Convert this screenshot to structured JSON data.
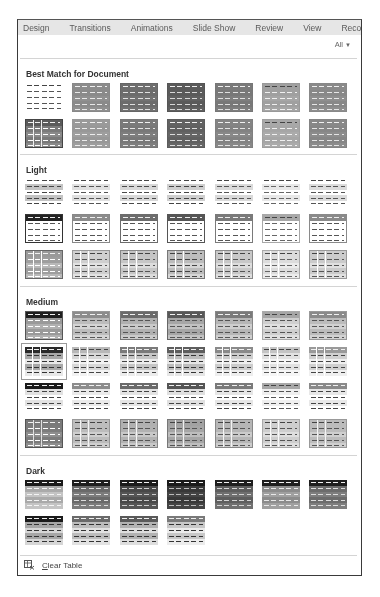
{
  "tabs": [
    "Design",
    "Transitions",
    "Animations",
    "Slide Show",
    "Review",
    "View",
    "Record"
  ],
  "filter": {
    "label": "All",
    "icon": "chevron-down-icon"
  },
  "sections": [
    {
      "title": "Best Match for Document",
      "top": 49,
      "grid_top": 63,
      "rows": [
        [
          {
            "hdr": "#ffffff",
            "body": "#ffffff",
            "band": "#ffffff",
            "dash": "#555",
            "border": "none",
            "vl": "transparent"
          },
          {
            "hdr": "#8c8c8c",
            "body": "#909090",
            "band": "#8a8a8a",
            "dash": "#e8e8e8",
            "border": "#888",
            "vl": "transparent"
          },
          {
            "hdr": "#6e6e6e",
            "body": "#727272",
            "band": "#6c6c6c",
            "dash": "#e0e0e0",
            "border": "#666",
            "vl": "transparent"
          },
          {
            "hdr": "#5a5a5a",
            "body": "#606060",
            "band": "#5a5a5a",
            "dash": "#d8d8d8",
            "border": "#555",
            "vl": "transparent"
          },
          {
            "hdr": "#7a7a7a",
            "body": "#7e7e7e",
            "band": "#787878",
            "dash": "#e0e0e0",
            "border": "#777",
            "vl": "transparent"
          },
          {
            "hdr": "#a0a0a0",
            "body": "#a6a6a6",
            "band": "#a0a0a0",
            "dash": "#f0f0f0",
            "border": "#999",
            "vl": "transparent"
          },
          {
            "hdr": "#8a8a8a",
            "body": "#8e8e8e",
            "band": "#888888",
            "dash": "#e6e6e6",
            "border": "#888",
            "vl": "transparent"
          }
        ],
        [
          {
            "hdr": "#5a5a5a",
            "body": "#8a8a8a",
            "band": "#7a7a7a",
            "dash": "#ffffff",
            "border": "#444",
            "vl": "#f0f0f0"
          },
          {
            "hdr": "#9a9a9a",
            "body": "#9e9e9e",
            "band": "#989898",
            "dash": "#ececec",
            "border": "#999",
            "vl": "transparent"
          },
          {
            "hdr": "#7a7a7a",
            "body": "#7e7e7e",
            "band": "#787878",
            "dash": "#e4e4e4",
            "border": "#777",
            "vl": "transparent"
          },
          {
            "hdr": "#626262",
            "body": "#666666",
            "band": "#606060",
            "dash": "#dcdcdc",
            "border": "#5c5c5c",
            "vl": "transparent"
          },
          {
            "hdr": "#848484",
            "body": "#888888",
            "band": "#828282",
            "dash": "#e4e4e4",
            "border": "#808080",
            "vl": "transparent"
          },
          {
            "hdr": "#a8a8a8",
            "body": "#ababab",
            "band": "#a6a6a6",
            "dash": "#f0f0f0",
            "border": "#a0a0a0",
            "vl": "transparent"
          },
          {
            "hdr": "#888888",
            "body": "#8c8c8c",
            "band": "#868686",
            "dash": "#e4e4e4",
            "border": "#848484",
            "vl": "transparent"
          }
        ]
      ]
    },
    {
      "title": "Light",
      "top": 145,
      "grid_top": 158,
      "rows": [
        [
          {
            "hdr": "#ffffff",
            "body": "#ffffff",
            "band": "#c4c4c4",
            "dash": "#444",
            "border": "none",
            "vl": "transparent"
          },
          {
            "hdr": "#ffffff",
            "body": "#ffffff",
            "band": "#e0e0e0",
            "dash": "#555",
            "border": "none",
            "vl": "transparent"
          },
          {
            "hdr": "#ffffff",
            "body": "#ffffff",
            "band": "#d8d8d8",
            "dash": "#4a4a4a",
            "border": "none",
            "vl": "transparent"
          },
          {
            "hdr": "#ffffff",
            "body": "#ffffff",
            "band": "#cfcfcf",
            "dash": "#444",
            "border": "none",
            "vl": "transparent"
          },
          {
            "hdr": "#ffffff",
            "body": "#ffffff",
            "band": "#dadada",
            "dash": "#555",
            "border": "none",
            "vl": "transparent"
          },
          {
            "hdr": "#ffffff",
            "body": "#ffffff",
            "band": "#e8e8e8",
            "dash": "#666",
            "border": "none",
            "vl": "transparent"
          },
          {
            "hdr": "#ffffff",
            "body": "#ffffff",
            "band": "#dcdcdc",
            "dash": "#555",
            "border": "none",
            "vl": "transparent"
          }
        ],
        [
          {
            "hdr": "#222222",
            "body": "#ffffff",
            "band": "#ffffff",
            "dash": "#555",
            "border": "#333",
            "vl": "transparent"
          },
          {
            "hdr": "#8c8c8c",
            "body": "#ffffff",
            "band": "#ffffff",
            "dash": "#555",
            "border": "#888",
            "vl": "transparent"
          },
          {
            "hdr": "#6c6c6c",
            "body": "#ffffff",
            "band": "#ffffff",
            "dash": "#555",
            "border": "#6c6c6c",
            "vl": "transparent"
          },
          {
            "hdr": "#555555",
            "body": "#ffffff",
            "band": "#ffffff",
            "dash": "#555",
            "border": "#555",
            "vl": "transparent"
          },
          {
            "hdr": "#7a7a7a",
            "body": "#ffffff",
            "band": "#ffffff",
            "dash": "#555",
            "border": "#7a7a7a",
            "vl": "transparent"
          },
          {
            "hdr": "#a8a8a8",
            "body": "#ffffff",
            "band": "#ffffff",
            "dash": "#666",
            "border": "#a8a8a8",
            "vl": "transparent"
          },
          {
            "hdr": "#8a8a8a",
            "body": "#ffffff",
            "band": "#ffffff",
            "dash": "#555",
            "border": "#8a8a8a",
            "vl": "transparent"
          }
        ],
        [
          {
            "hdr": "#9a9a9a",
            "body": "#b8b8b8",
            "band": "#9e9e9e",
            "dash": "#ffffff",
            "border": "#666",
            "vl": "#ffffff"
          },
          {
            "hdr": "#d0d0d0",
            "body": "#e2e2e2",
            "band": "#cfcfcf",
            "dash": "#555",
            "border": "#999",
            "vl": "#ffffff"
          },
          {
            "hdr": "#c4c4c4",
            "body": "#dcdcdc",
            "band": "#c6c6c6",
            "dash": "#555",
            "border": "#888",
            "vl": "#ffffff"
          },
          {
            "hdr": "#bdbdbd",
            "body": "#d6d6d6",
            "band": "#bcbcbc",
            "dash": "#444",
            "border": "#777",
            "vl": "#ffffff"
          },
          {
            "hdr": "#c8c8c8",
            "body": "#dddddd",
            "band": "#c8c8c8",
            "dash": "#555",
            "border": "#888",
            "vl": "#ffffff"
          },
          {
            "hdr": "#dcdcdc",
            "body": "#ececec",
            "band": "#dcdcdc",
            "dash": "#666",
            "border": "#aaa",
            "vl": "#ffffff"
          },
          {
            "hdr": "#cccccc",
            "body": "#e0e0e0",
            "band": "#cbcbcb",
            "dash": "#555",
            "border": "#999",
            "vl": "#ffffff"
          }
        ]
      ]
    },
    {
      "title": "Medium",
      "top": 277,
      "grid_top": 291,
      "rows": [
        [
          {
            "hdr": "#1e1e1e",
            "body": "#b0b0b0",
            "band": "#9a9a9a",
            "dash": "#ffffff",
            "border": "#555",
            "vl": "transparent"
          },
          {
            "hdr": "#8c8c8c",
            "body": "#d4d4d4",
            "band": "#bcbcbc",
            "dash": "#555",
            "border": "#999",
            "vl": "transparent"
          },
          {
            "hdr": "#6a6a6a",
            "body": "#cacaca",
            "band": "#b0b0b0",
            "dash": "#555",
            "border": "#777",
            "vl": "transparent"
          },
          {
            "hdr": "#575757",
            "body": "#c2c2c2",
            "band": "#a6a6a6",
            "dash": "#555",
            "border": "#666",
            "vl": "transparent"
          },
          {
            "hdr": "#7a7a7a",
            "body": "#cecece",
            "band": "#b6b6b6",
            "dash": "#555",
            "border": "#888",
            "vl": "transparent"
          },
          {
            "hdr": "#a6a6a6",
            "body": "#e0e0e0",
            "band": "#cfcfcf",
            "dash": "#555",
            "border": "#aaa",
            "vl": "transparent"
          },
          {
            "hdr": "#8a8a8a",
            "body": "#d2d2d2",
            "band": "#bcbcbc",
            "dash": "#555",
            "border": "#999",
            "vl": "transparent"
          }
        ],
        [
          {
            "hdr": "#2a2a2a",
            "body": "#e8e8e8",
            "band": "#a8a8a8",
            "dash": "#333",
            "border": "none",
            "vl": "#ffffff",
            "selected": true
          },
          {
            "hdr": "#b8b8b8",
            "body": "#f2f2f2",
            "band": "#d8d8d8",
            "dash": "#444",
            "border": "none",
            "vl": "#ffffff"
          },
          {
            "hdr": "#7a7a7a",
            "body": "#ececec",
            "band": "#c6c6c6",
            "dash": "#444",
            "border": "none",
            "vl": "#ffffff"
          },
          {
            "hdr": "#5e5e5e",
            "body": "#e6e6e6",
            "band": "#bdbdbd",
            "dash": "#333",
            "border": "none",
            "vl": "#ffffff"
          },
          {
            "hdr": "#8a8a8a",
            "body": "#eeeeee",
            "band": "#cdcdcd",
            "dash": "#444",
            "border": "none",
            "vl": "#ffffff"
          },
          {
            "hdr": "#c4c4c4",
            "body": "#f6f6f6",
            "band": "#e2e2e2",
            "dash": "#555",
            "border": "none",
            "vl": "#ffffff"
          },
          {
            "hdr": "#9a9a9a",
            "body": "#efefef",
            "band": "#d0d0d0",
            "dash": "#444",
            "border": "none",
            "vl": "#ffffff"
          }
        ],
        [
          {
            "hdr": "#1a1a1a",
            "body": "#ffffff",
            "band": "#e2e2e2",
            "dash": "#444",
            "border": "none",
            "vl": "transparent"
          },
          {
            "hdr": "#8c8c8c",
            "body": "#ffffff",
            "band": "#eaeaea",
            "dash": "#444",
            "border": "none",
            "vl": "transparent"
          },
          {
            "hdr": "#6a6a6a",
            "body": "#ffffff",
            "band": "#e4e4e4",
            "dash": "#444",
            "border": "none",
            "vl": "transparent"
          },
          {
            "hdr": "#545454",
            "body": "#ffffff",
            "band": "#e0e0e0",
            "dash": "#444",
            "border": "none",
            "vl": "transparent"
          },
          {
            "hdr": "#7a7a7a",
            "body": "#ffffff",
            "band": "#e6e6e6",
            "dash": "#444",
            "border": "none",
            "vl": "transparent"
          },
          {
            "hdr": "#a8a8a8",
            "body": "#ffffff",
            "band": "#efefef",
            "dash": "#555",
            "border": "none",
            "vl": "transparent"
          },
          {
            "hdr": "#8a8a8a",
            "body": "#ffffff",
            "band": "#e8e8e8",
            "dash": "#444",
            "border": "none",
            "vl": "transparent"
          }
        ],
        [
          {
            "hdr": "#7a7a7a",
            "body": "#8e8e8e",
            "band": "#7c7c7c",
            "dash": "#ffffff",
            "border": "#555",
            "vl": "#e0e0e0"
          },
          {
            "hdr": "#bdbdbd",
            "body": "#cfcfcf",
            "band": "#bcbcbc",
            "dash": "#555",
            "border": "#999",
            "vl": "#f4f4f4"
          },
          {
            "hdr": "#b0b0b0",
            "body": "#c8c8c8",
            "band": "#b2b2b2",
            "dash": "#555",
            "border": "#888",
            "vl": "#f4f4f4"
          },
          {
            "hdr": "#a2a2a2",
            "body": "#bdbdbd",
            "band": "#a6a6a6",
            "dash": "#555",
            "border": "#777",
            "vl": "#f0f0f0"
          },
          {
            "hdr": "#b6b6b6",
            "body": "#cbcbcb",
            "band": "#b6b6b6",
            "dash": "#555",
            "border": "#888",
            "vl": "#f4f4f4"
          },
          {
            "hdr": "#cfcfcf",
            "body": "#dedede",
            "band": "#cecece",
            "dash": "#555",
            "border": "#aaa",
            "vl": "#f8f8f8"
          },
          {
            "hdr": "#bcbcbc",
            "body": "#cfcfcf",
            "band": "#bcbcbc",
            "dash": "#555",
            "border": "#999",
            "vl": "#f4f4f4"
          }
        ]
      ]
    },
    {
      "title": "Dark",
      "top": 446,
      "grid_top": 460,
      "rows": [
        [
          {
            "hdr": "#1a1a1a",
            "body": "#c4c4c4",
            "band": "#aaaaaa",
            "dash": "#f4f4f4",
            "border": "none",
            "vl": "transparent"
          },
          {
            "hdr": "#1e1e1e",
            "body": "#7c7c7c",
            "band": "#6a6a6a",
            "dash": "#dddddd",
            "border": "none",
            "vl": "transparent"
          },
          {
            "hdr": "#1a1a1a",
            "body": "#555555",
            "band": "#484848",
            "dash": "#cccccc",
            "border": "none",
            "vl": "transparent"
          },
          {
            "hdr": "#1a1a1a",
            "body": "#444444",
            "band": "#383838",
            "dash": "#bbbbbb",
            "border": "none",
            "vl": "transparent"
          },
          {
            "hdr": "#1e1e1e",
            "body": "#707070",
            "band": "#5e5e5e",
            "dash": "#d4d4d4",
            "border": "none",
            "vl": "transparent"
          },
          {
            "hdr": "#1e1e1e",
            "body": "#a0a0a0",
            "band": "#8c8c8c",
            "dash": "#e8e8e8",
            "border": "none",
            "vl": "transparent"
          },
          {
            "hdr": "#1e1e1e",
            "body": "#7e7e7e",
            "band": "#6c6c6c",
            "dash": "#dddddd",
            "border": "none",
            "vl": "transparent"
          }
        ],
        [
          {
            "hdr": "#1a1a1a",
            "body": "#d6d6d6",
            "band": "#a6a6a6",
            "dash": "#333",
            "border": "none",
            "vl": "transparent"
          },
          {
            "hdr": "#6a6a6a",
            "body": "#e2e2e2",
            "band": "#bcbcbc",
            "dash": "#333",
            "border": "none",
            "vl": "transparent"
          },
          {
            "hdr": "#5a5a5a",
            "body": "#dedede",
            "band": "#b2b2b2",
            "dash": "#333",
            "border": "none",
            "vl": "transparent"
          },
          {
            "hdr": "#7a7a7a",
            "body": "#ececec",
            "band": "#c8c8c8",
            "dash": "#333",
            "border": "none",
            "vl": "transparent"
          }
        ]
      ]
    }
  ],
  "footer": {
    "icon": "clear-table-icon",
    "label_underlined": "C",
    "label_rest": "lear Table"
  },
  "colors": {
    "panel_border": "#3a3a3a",
    "tabbar_bg": "#e6e6e6",
    "separator": "#d4d4d4",
    "selected_frame": "#9a9a9a"
  }
}
